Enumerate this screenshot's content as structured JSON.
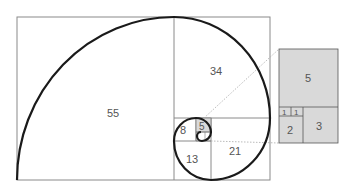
{
  "diagram": {
    "squares": [
      "55",
      "34",
      "21",
      "13",
      "8",
      "5",
      "3",
      "2",
      "1",
      "1"
    ],
    "labels": {
      "s55": "55",
      "s34": "34",
      "s21": "21",
      "s13": "13",
      "s8": "8",
      "s5": "5",
      "z5": "5",
      "z3": "3",
      "z2": "2",
      "z1a": "1",
      "z1b": "1"
    },
    "colors": {
      "line": "#777777",
      "spiral": "#1a1a1a",
      "shade": "#d9d9d9",
      "dotted": "#aaaaaa"
    }
  }
}
